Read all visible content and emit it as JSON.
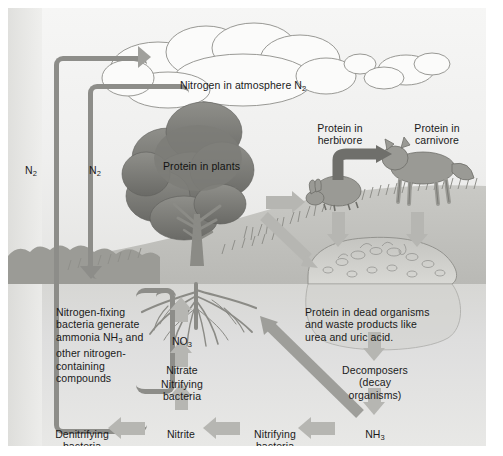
{
  "diagram": {
    "palette": {
      "arrow_light": "#b6b6b2",
      "arrow_mid": "#a0a09c",
      "arrow_dark": "#7a7a76",
      "pipe": "#8d8d89",
      "sky": "#f2f2f0",
      "soil": "#ddddda",
      "canopy_dark": "#6f6f6b",
      "canopy_mid": "#8a8a86",
      "text": "#1a1a1a",
      "soil_line": "#8e8e8a"
    }
  },
  "labels": {
    "atmosphere": "Nitrogen in atmosphere N",
    "atmosphere_sub": "2",
    "n2_left": "N",
    "n2_left_sub": "2",
    "n2_right": "N",
    "n2_right_sub": "2",
    "protein_plants": "Protein in plants",
    "protein_herbivore": "Protein in\nherbivore",
    "protein_carnivore": "Protein in\ncarnivore",
    "nitrogen_fixing": "Nitrogen-fixing\nbacteria generate\nammonia NH",
    "nitrogen_fixing_sub": "3",
    "nitrogen_fixing_cont": " and\nother nitrogen-\ncontaining\ncompounds",
    "nitrate_formula": "NO",
    "nitrate_formula_sub": "3",
    "nitrate_name": "Nitrate",
    "nitrifying_bacteria_up": "Nitrifying\nbacteria",
    "nitrite_name": "Nitrite",
    "nitrite_formula": "–NO",
    "nitrite_formula_sub": "2",
    "nitrifying_bacteria_bottom": "Nitrifying\nbacteria",
    "denitrifying_bacteria": "Denitrifying\nbacteria",
    "ammonia_formula": "NH",
    "ammonia_formula_sub": "3",
    "ammonia_name": "Ammonia",
    "dead_organisms": "Protein in dead organisms\nand waste products like\nurea and uric acid.",
    "decomposers": "Decomposers\n(decay\norganisms)"
  },
  "icons": {
    "cloud": "cloud-icon",
    "tree": "tree-icon",
    "rabbit": "rabbit-icon",
    "fox": "fox-icon",
    "compost": "compost-pile-icon",
    "roots": "roots-icon",
    "grass": "grass-icon"
  },
  "flows": [
    {
      "name": "denitrifying-to-atmosphere",
      "from": "Denitrifying bacteria",
      "to": "Nitrogen in atmosphere N2",
      "label": "N2"
    },
    {
      "name": "nitrogen-fixing-from-atmosphere",
      "from": "Nitrogen in atmosphere N2",
      "to": "Nitrogen-fixing bacteria",
      "label": "N2"
    },
    {
      "name": "plants-to-herbivore",
      "from": "Protein in plants",
      "to": "Protein in herbivore"
    },
    {
      "name": "herbivore-to-carnivore",
      "from": "Protein in herbivore",
      "to": "Protein in carnivore"
    },
    {
      "name": "plants-to-dead-organisms",
      "from": "Protein in plants",
      "to": "Protein in dead organisms"
    },
    {
      "name": "herbivore-to-dead-organisms",
      "from": "Protein in herbivore",
      "to": "Protein in dead organisms"
    },
    {
      "name": "carnivore-to-dead-organisms",
      "from": "Protein in carnivore",
      "to": "Protein in dead organisms"
    },
    {
      "name": "dead-to-decomposers",
      "from": "Protein in dead organisms",
      "to": "Decomposers"
    },
    {
      "name": "decomposers-to-ammonia",
      "from": "Decomposers",
      "to": "NH3 Ammonia"
    },
    {
      "name": "ammonia-to-nitrifying",
      "from": "NH3 Ammonia",
      "to": "Nitrifying bacteria"
    },
    {
      "name": "nitrifying-to-nitrite",
      "from": "Nitrifying bacteria",
      "to": "Nitrite -NO2"
    },
    {
      "name": "nitrite-to-denitrifying",
      "from": "Nitrite -NO2",
      "to": "Denitrifying bacteria"
    },
    {
      "name": "nitrite-to-nitrifying-up",
      "from": "Nitrite -NO2",
      "to": "Nitrifying bacteria"
    },
    {
      "name": "nitrifying-to-nitrate",
      "from": "Nitrifying bacteria",
      "to": "NO3 Nitrate"
    },
    {
      "name": "nitrate-to-roots",
      "from": "NO3 Nitrate",
      "to": "Protein in plants"
    },
    {
      "name": "ammonia-to-roots",
      "from": "NH3 Ammonia",
      "to": "roots"
    },
    {
      "name": "nitrogen-fixing-to-roots",
      "from": "Nitrogen-fixing bacteria",
      "to": "roots"
    }
  ]
}
